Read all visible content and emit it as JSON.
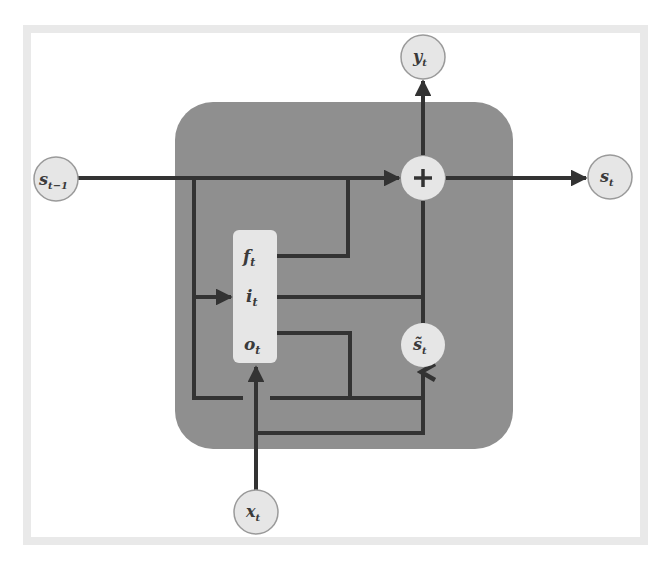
{
  "diagram": {
    "type": "recurrent-cell-schematic",
    "colors": {
      "frame": "#e9e9e9",
      "cell_fill": "#8f8f8f",
      "node_fill": "#e6e6e6",
      "node_stroke": "#9a9a9a",
      "line": "#333333"
    },
    "nodes": {
      "prev_state": {
        "base": "s",
        "sub": "t−1"
      },
      "output": {
        "base": "y",
        "sub": "t"
      },
      "sum": {
        "symbol": "+"
      },
      "next_state": {
        "base": "s",
        "sub": "t"
      },
      "candidate": {
        "base": "s̃",
        "sub": "t"
      },
      "input": {
        "base": "x",
        "sub": "t"
      }
    },
    "gates": [
      {
        "base": "f",
        "sub": "t"
      },
      {
        "base": "i",
        "sub": "t"
      },
      {
        "base": "o",
        "sub": "t"
      }
    ],
    "edges": [
      {
        "from": "s_{t-1}",
        "to": "+"
      },
      {
        "from": "+",
        "to": "y_t"
      },
      {
        "from": "+",
        "to": "s_t"
      },
      {
        "from": "s_{t-1}",
        "to": "gates"
      },
      {
        "from": "x_t",
        "to": "gates"
      },
      {
        "from": "x_t",
        "to": "s̃_t"
      },
      {
        "from": "f_t",
        "to": "s_{t-1} path"
      },
      {
        "from": "i_t",
        "to": "s̃_t path"
      },
      {
        "from": "o_t",
        "to": "s̃_t"
      },
      {
        "from": "s̃_t",
        "to": "+"
      }
    ]
  }
}
